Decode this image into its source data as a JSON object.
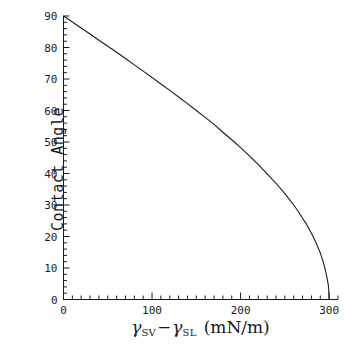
{
  "chart_data": {
    "type": "line",
    "title": "",
    "subtitle": "",
    "xlabel_parts": {
      "gamma1": "γ",
      "sub1": "SV",
      "operator": "−",
      "gamma2": "γ",
      "sub2": "SL",
      "units": "(mN/m)"
    },
    "xlabel": "γSV − γSL  (mN/m)",
    "ylabel": "Contact Angle",
    "xlim": [
      0,
      310
    ],
    "ylim": [
      0,
      90
    ],
    "xticks": [
      0,
      100,
      200,
      300
    ],
    "xticklabels": [
      "0",
      "100",
      "200",
      "300"
    ],
    "yticks": [
      0,
      10,
      20,
      30,
      40,
      50,
      60,
      70,
      80,
      90
    ],
    "yticklabels": [
      "0",
      "10",
      "20",
      "30",
      "40",
      "50",
      "60",
      "70",
      "80",
      "90"
    ],
    "x_minor_interval": 10,
    "y_minor_interval": 2,
    "grid": false,
    "legend": "none",
    "axis_style": "left-and-bottom-spines-only",
    "line_color": "#1a1a1a",
    "line_width": 1,
    "background_color": "#ffffff",
    "relation": "theta = arccos((gamma_SV - gamma_SL) / gamma_LV), gamma_LV = 300 mN/m",
    "series": [
      {
        "name": "contact angle",
        "x": [
          0,
          10,
          20,
          30,
          40,
          50,
          60,
          70,
          80,
          90,
          100,
          110,
          120,
          130,
          140,
          150,
          160,
          170,
          180,
          190,
          200,
          210,
          220,
          230,
          240,
          250,
          255,
          260,
          265,
          270,
          275,
          280,
          285,
          290,
          293,
          295,
          297,
          298,
          299,
          299.5,
          300
        ],
        "y": [
          90,
          88.1,
          86.2,
          84.3,
          82.3,
          80.4,
          78.5,
          76.5,
          74.5,
          72.5,
          70.5,
          68.4,
          66.4,
          64.3,
          62.2,
          60,
          57.8,
          55.6,
          53.1,
          50.7,
          48.2,
          45.6,
          42.8,
          39.9,
          36.9,
          33.6,
          31.8,
          30,
          28,
          25.8,
          23.6,
          21,
          18.2,
          14.8,
          12.2,
          10.2,
          7.7,
          6.2,
          4.7,
          3.3,
          0
        ]
      }
    ]
  },
  "axes": {
    "x_axis_name": "gamma-difference-axis",
    "y_axis_name": "contact-angle-axis"
  }
}
